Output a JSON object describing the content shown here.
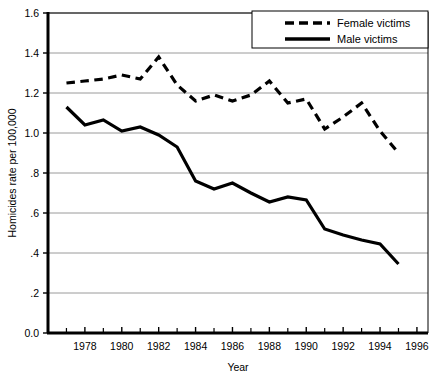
{
  "chart_data": {
    "type": "line",
    "title": "",
    "xlabel": "Year",
    "ylabel": "Homicides rate per 100,000",
    "xlim": [
      1976,
      1996.6
    ],
    "ylim": [
      0.0,
      1.6
    ],
    "grid": true,
    "legend_position": "top-right",
    "x": [
      1977,
      1978,
      1979,
      1980,
      1981,
      1982,
      1983,
      1984,
      1985,
      1986,
      1987,
      1988,
      1989,
      1990,
      1991,
      1992,
      1993,
      1994,
      1995
    ],
    "xticks_major": [
      1978,
      1980,
      1982,
      1984,
      1986,
      1988,
      1990,
      1992,
      1994,
      1996
    ],
    "xticks_minor": [
      1977,
      1979,
      1981,
      1983,
      1985,
      1987,
      1989,
      1991,
      1993,
      1995
    ],
    "xtick_labels": [
      "1978",
      "1980",
      "1982",
      "1984",
      "1986",
      "1988",
      "1990",
      "1992",
      "1994",
      "1996"
    ],
    "yticks": [
      0.0,
      0.2,
      0.4,
      0.6,
      0.8,
      1.0,
      1.2,
      1.4,
      1.6
    ],
    "ytick_labels": [
      "0.0",
      ".2",
      ".4",
      ".6",
      ".8",
      "1.0",
      "1.2",
      "1.4",
      "1.6"
    ],
    "series": [
      {
        "name": "Female victims",
        "style": "dashed",
        "color": "#000000",
        "values": [
          1.25,
          1.26,
          1.27,
          1.29,
          1.27,
          1.38,
          1.24,
          1.16,
          1.19,
          1.16,
          1.19,
          1.26,
          1.15,
          1.17,
          1.02,
          1.08,
          1.15,
          1.01,
          0.9
        ]
      },
      {
        "name": "Male victims",
        "style": "solid",
        "color": "#000000",
        "values": [
          1.13,
          1.04,
          1.065,
          1.01,
          1.03,
          0.99,
          0.93,
          0.76,
          0.72,
          0.75,
          0.7,
          0.655,
          0.68,
          0.665,
          0.52,
          0.49,
          0.465,
          0.445,
          0.345
        ]
      }
    ]
  },
  "legend": {
    "items": [
      {
        "label": "Female victims",
        "style": "dashed"
      },
      {
        "label": "Male victims",
        "style": "solid"
      }
    ]
  },
  "axes": {
    "y_title": "Homicides rate per 100,000",
    "x_title": "Year"
  }
}
